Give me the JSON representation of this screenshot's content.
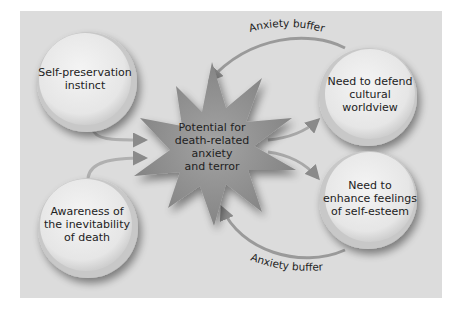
{
  "diagram": {
    "nodes": {
      "self_preservation": "Self-preservation instinct",
      "self_preservation_lines": [
        "Self-preservation",
        "instinct"
      ],
      "awareness_death": "Awareness of the inevitability of death",
      "awareness_death_lines": [
        "Awareness of",
        "the inevitability",
        "of death"
      ],
      "potential_anxiety": "Potential for death-related anxiety and terror",
      "potential_anxiety_lines": [
        "Potential for",
        "death-related",
        "anxiety",
        "and terror"
      ],
      "defend_worldview": "Need to defend cultural worldview",
      "defend_worldview_lines": [
        "Need to defend",
        "cultural",
        "worldview"
      ],
      "self_esteem": "Need to enhance feelings of self-esteem",
      "self_esteem_lines": [
        "Need to",
        "enhance feelings",
        "of self-esteem"
      ]
    },
    "edges": [
      {
        "from": "self_preservation",
        "to": "potential_anxiety",
        "label": ""
      },
      {
        "from": "awareness_death",
        "to": "potential_anxiety",
        "label": ""
      },
      {
        "from": "potential_anxiety",
        "to": "defend_worldview",
        "label": ""
      },
      {
        "from": "potential_anxiety",
        "to": "self_esteem",
        "label": ""
      },
      {
        "from": "defend_worldview",
        "to": "potential_anxiety",
        "label": "Anxiety buffer"
      },
      {
        "from": "self_esteem",
        "to": "potential_anxiety",
        "label": "Anxiety buffer"
      }
    ],
    "top_buffer_label": "Anxiety buffer",
    "bottom_buffer_label": "Anxiety buffer"
  },
  "credit": "© Cengage Learning",
  "colors": {
    "panel_bg": "#dcdcdc",
    "circle_fill": "#ececec",
    "circle_rim": "#b5b5b5",
    "starburst": "#8f8f8f",
    "arrow": "#9a9a9a",
    "text": "#222222"
  }
}
